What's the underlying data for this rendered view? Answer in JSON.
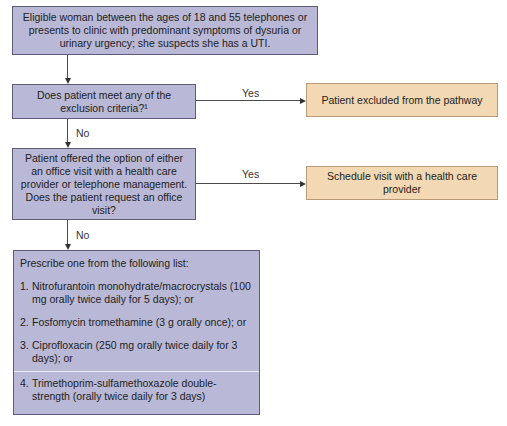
{
  "flowchart": {
    "start": {
      "text": "Eligible woman between the ages of 18 and 55 telephones or presents to clinic with predominant symptoms of dysuria or urinary urgency; she suspects she has a UTI."
    },
    "decision_exclusion": {
      "text": "Does patient meet any of the exclusion criteria?¹",
      "yes_label": "Yes",
      "no_label": "No"
    },
    "outcome_excluded": {
      "text": "Patient excluded from the pathway"
    },
    "decision_office_visit": {
      "text": "Patient offered the option of either an office visit with a health care provider or telephone management. Does the patient request an office visit?",
      "yes_label": "Yes",
      "no_label": "No"
    },
    "outcome_schedule": {
      "text": "Schedule visit with a health care provider"
    },
    "prescribe": {
      "intro": "Prescribe one from the following list:",
      "items": [
        {
          "num": "1.",
          "text": "Nitrofurantoin monohydrate/macrocrystals (100 mg orally twice daily for 5 days); or"
        },
        {
          "num": "2.",
          "text": "Fosfomycin tromethamine (3 g orally once); or"
        },
        {
          "num": "3.",
          "text": "Ciprofloxacin (250 mg orally twice daily for 3 days); or"
        },
        {
          "num": "4.",
          "text": "Trimethoprim-sulfamethoxazole double-strength (orally twice daily for 3 days)"
        }
      ]
    },
    "colors": {
      "process_fill": "#b9b8d6",
      "process_border": "#5d5b7a",
      "outcome_fill": "#f3d9b3",
      "outcome_border": "#b89a78"
    }
  }
}
